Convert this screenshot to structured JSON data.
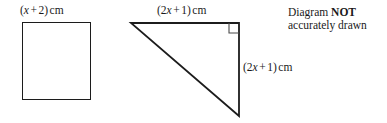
{
  "page": {
    "width": 387,
    "height": 123,
    "background": "#ffffff",
    "ink": "#1c1c1c"
  },
  "figures": {
    "square": {
      "name": "square",
      "side_label": {
        "open_paren": "(",
        "variable": "x",
        "operator": "+",
        "constant": "2",
        "close_paren": ")",
        "unit": "cm",
        "plain": "(x + 2) cm"
      }
    },
    "triangle": {
      "name": "right-angled-triangle",
      "right_angle_marker": true,
      "top_label": {
        "open_paren": "(",
        "coefficient": "2",
        "variable": "x",
        "operator": "+",
        "constant": "1",
        "close_paren": ")",
        "unit": "cm",
        "plain": "(2x + 1) cm"
      },
      "right_label": {
        "open_paren": "(",
        "coefficient": "2",
        "variable": "x",
        "operator": "+",
        "constant": "1",
        "close_paren": ")",
        "unit": "cm",
        "plain": "(2x + 1) cm"
      }
    }
  },
  "note": {
    "line1_prefix": "Diagram",
    "line1_emphasis": "NOT",
    "line2": "accurately drawn"
  }
}
